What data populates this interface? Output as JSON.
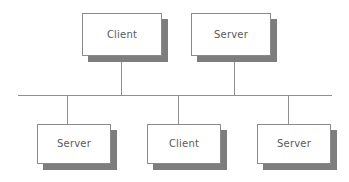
{
  "diagram": {
    "type": "network-topology",
    "colors": {
      "background": "#ffffff",
      "box_fill": "#ffffff",
      "box_border": "#8a8a8a",
      "box_shadow": "#7d7d7d",
      "line": "#8f8f8f",
      "label_text": "#5a5a5a"
    },
    "bus": {
      "name": "bus-backbone",
      "orientation": "horizontal",
      "x": 18,
      "y": 95,
      "width": 314
    },
    "nodes": [
      {
        "id": "node-top-client",
        "label": "Client",
        "role": "Client",
        "row": "top",
        "x": 82,
        "y": 13,
        "width": 80,
        "height": 43,
        "connector_x": 121,
        "connector_from_y": 56,
        "connector_to_y": 95
      },
      {
        "id": "node-top-server",
        "label": "Server",
        "role": "Server",
        "row": "top",
        "x": 191,
        "y": 13,
        "width": 80,
        "height": 43,
        "connector_x": 234,
        "connector_from_y": 56,
        "connector_to_y": 95
      },
      {
        "id": "node-bottom-server-left",
        "label": "Server",
        "role": "Server",
        "row": "bottom",
        "x": 37,
        "y": 124,
        "width": 74,
        "height": 40,
        "connector_x": 67,
        "connector_from_y": 95,
        "connector_to_y": 124
      },
      {
        "id": "node-bottom-client",
        "label": "Client",
        "role": "Client",
        "row": "bottom",
        "x": 147,
        "y": 124,
        "width": 74,
        "height": 40,
        "connector_x": 178,
        "connector_from_y": 95,
        "connector_to_y": 124
      },
      {
        "id": "node-bottom-server-right",
        "label": "Server",
        "role": "Server",
        "row": "bottom",
        "x": 257,
        "y": 124,
        "width": 74,
        "height": 40,
        "connector_x": 288,
        "connector_from_y": 95,
        "connector_to_y": 124
      }
    ]
  }
}
